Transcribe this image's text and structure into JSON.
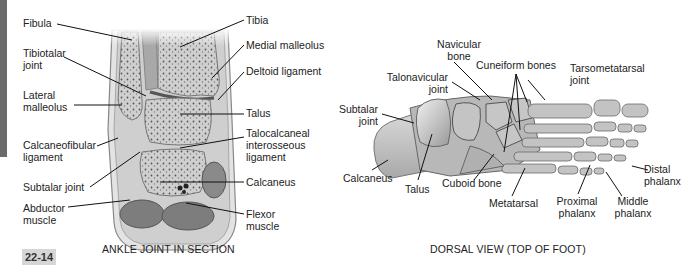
{
  "figure_number": "22-14",
  "panels": [
    {
      "id": "ankle-section",
      "caption": "ANKLE JOINT IN SECTION",
      "labels_left": [
        {
          "text": "Fibula"
        },
        {
          "text": "Tibiotalar\njoint",
          "line1": "Tibiotalar",
          "line2": "joint"
        },
        {
          "text": "Lateral\nmalleolus",
          "line1": "Lateral",
          "line2": "malleolus"
        },
        {
          "text": "Calcaneofibular\nligament",
          "line1": "Calcaneofibular",
          "line2": "ligament"
        },
        {
          "text": "Subtalar joint"
        },
        {
          "text": "Abductor\nmuscle",
          "line1": "Abductor",
          "line2": "muscle"
        }
      ],
      "labels_right": [
        {
          "text": "Tibia"
        },
        {
          "text": "Medial malleolus"
        },
        {
          "text": "Deltoid ligament"
        },
        {
          "text": "Talus"
        },
        {
          "text": "Talocalcaneal\ninterosseous\nligament",
          "line1": "Talocalcaneal",
          "line2": "interosseous",
          "line3": "ligament"
        },
        {
          "text": "Calcaneus"
        },
        {
          "text": "Flexor\nmuscle",
          "line1": "Flexor",
          "line2": "muscle"
        }
      ]
    },
    {
      "id": "dorsal-view",
      "caption": "DORSAL VIEW (TOP OF FOOT)",
      "labels_top": [
        {
          "line1": "Navicular",
          "line2": "bone"
        },
        {
          "line1": "Talonavicular",
          "line2": "joint"
        },
        {
          "text": "Cuneiform bones"
        },
        {
          "line1": "Tarsometatarsal",
          "line2": "joint"
        },
        {
          "line1": "Subtalar",
          "line2": "joint"
        }
      ],
      "labels_bottom": [
        {
          "text": "Calcaneus"
        },
        {
          "text": "Talus"
        },
        {
          "text": "Cuboid bone"
        },
        {
          "text": "Metatarsal"
        },
        {
          "line1": "Proximal",
          "line2": "phalanx"
        },
        {
          "line1": "Middle",
          "line2": "phalanx"
        },
        {
          "line1": "Distal",
          "line2": "phalanx"
        }
      ]
    }
  ],
  "colors": {
    "sidebar_bar": "#6b6b6b",
    "figure_badge_bg": "#d6d6d6",
    "bone": "#c9c9c9",
    "bone_dark": "#8e8e8e",
    "muscle": "#7a7a7a",
    "text": "#222222"
  }
}
